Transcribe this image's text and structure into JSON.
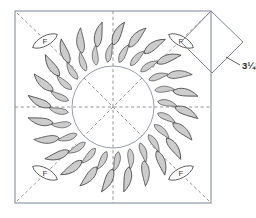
{
  "figure": {
    "type": "quilt-block-pattern-diagram",
    "background_color": "#ffffff"
  },
  "block": {
    "name": "background-square",
    "shape": "square",
    "x": 15,
    "y": 11,
    "width": 196,
    "height": 192,
    "stroke_color": "#6b7280",
    "fill_color": "#ffffff"
  },
  "guide_lines": {
    "name": "fold-guide-lines",
    "style": "dashed",
    "color": "#7a7a7a",
    "lines": [
      "vertical-center",
      "horizontal-center",
      "diagonal-tl-br",
      "diagonal-tr-bl"
    ]
  },
  "inner_circle": {
    "name": "wreath-inner-circle",
    "cx": 113,
    "cy": 107,
    "r": 41,
    "stroke_color": "#6b7280"
  },
  "wreath": {
    "name": "feathered-wreath",
    "center_x": 113,
    "center_y": 107,
    "rings": [
      {
        "name": "inner-feather-ring",
        "count": 24,
        "radius": 52,
        "leaf_length": 22,
        "leaf_width": 9
      },
      {
        "name": "outer-feather-ring",
        "count": 24,
        "radius": 72,
        "leaf_length": 26,
        "leaf_width": 10.5
      }
    ],
    "leaf_fill": "#cccccc",
    "leaf_stroke": "#4a4a4a"
  },
  "corner_markers": [
    {
      "id": "corner-top-left",
      "label": "F",
      "cx": 45,
      "cy": 41,
      "angle": -45
    },
    {
      "id": "corner-top-right",
      "label": "F",
      "cx": 181,
      "cy": 41,
      "angle": 45
    },
    {
      "id": "corner-bottom-left",
      "label": "F",
      "cx": 45,
      "cy": 173,
      "angle": 45
    },
    {
      "id": "corner-bottom-right",
      "label": "F",
      "cx": 181,
      "cy": 173,
      "angle": -45
    }
  ],
  "corner_marker": {
    "fill_color": "#ffffff",
    "stroke_color": "#4a4a4a",
    "letter": "F",
    "letter_meaning": "F"
  },
  "dimension_callout": {
    "name": "diamond-dimension",
    "label": "3¼\"",
    "shape": "diamond",
    "points": "211,11 243,42 212,73 181,42",
    "stroke_color": "#6b7280",
    "leader_from_x": 228,
    "leader_from_y": 58,
    "leader_to_x": 241,
    "leader_to_y": 66,
    "label_x": 243,
    "label_y": 70
  }
}
